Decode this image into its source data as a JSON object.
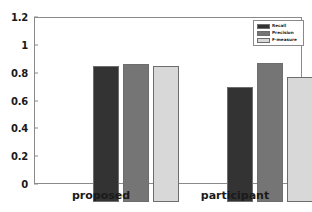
{
  "chart_data": {
    "type": "bar",
    "title": "",
    "xlabel": "",
    "ylabel": "",
    "categories": [
      "proposed",
      "participant"
    ],
    "series": [
      {
        "name": "Recall",
        "values": [
          0.98,
          0.83
        ],
        "color": "#333333"
      },
      {
        "name": "Precision",
        "values": [
          0.99,
          1.0
        ],
        "color": "#757575"
      },
      {
        "name": "F-measure",
        "values": [
          0.98,
          0.9
        ],
        "color": "#d8d8d8"
      }
    ],
    "ylim": [
      0,
      1.2
    ],
    "yticks": [
      "0",
      "0.2",
      "0.4",
      "0.6",
      "0.8",
      "1",
      "1.2"
    ],
    "ytick_values": [
      0,
      0.2,
      0.4,
      0.6,
      0.8,
      1,
      1.2
    ],
    "grid": false,
    "legend_position": "top-right"
  },
  "axes": {
    "frame_color": "#8a8a8a",
    "tick_label_color": "#1a1a1a"
  }
}
